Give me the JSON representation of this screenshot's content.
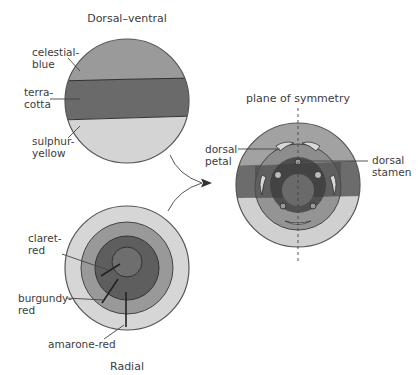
{
  "figure": {
    "top_diagram": {
      "title": "Dorsal–ventral",
      "labels": [
        {
          "line1": "celestial-",
          "line2": "blue"
        },
        {
          "line1": "terra-",
          "line2": "cotta"
        },
        {
          "line1": "sulphur-",
          "line2": "yellow"
        }
      ],
      "colors": {
        "upper": "#9a9a9a",
        "band": "#6a6a6a",
        "lower": "#d4d4d4"
      }
    },
    "bottom_diagram": {
      "title": "Radial",
      "labels": [
        {
          "line1": "claret-",
          "line2": "red"
        },
        {
          "line1": "burgundy-",
          "line2": "red"
        },
        {
          "line1": "amarone-red",
          "line2": ""
        }
      ],
      "colors": {
        "outer": "#d6d6d6",
        "ring2": "#999999",
        "ring3": "#5e5e5e",
        "center": "#6e6e6e"
      }
    },
    "right_diagram": {
      "title": "plane of symmetry",
      "labels": [
        {
          "line1": "dorsal",
          "line2": "petal"
        },
        {
          "line1": "dorsal",
          "line2": "stamen"
        }
      ]
    }
  }
}
